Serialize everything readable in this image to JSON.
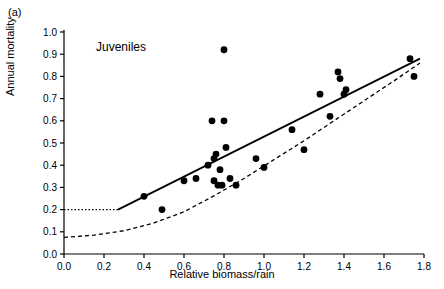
{
  "panel": {
    "label": "(a)"
  },
  "chart_data": {
    "type": "scatter",
    "title": "",
    "series_label": "Juveniles",
    "xlabel": "Relative biomass/rain",
    "ylabel": "Annual mortality",
    "xlim": [
      0.0,
      1.8
    ],
    "ylim": [
      0.0,
      1.0
    ],
    "xticks": [
      0.0,
      0.2,
      0.4,
      0.6,
      0.8,
      1.0,
      1.2,
      1.4,
      1.6,
      1.8
    ],
    "xticklabels": [
      "0.0",
      "0.2",
      "0.4",
      "0.6",
      "0.8",
      "1.0",
      "1.2",
      "1.4",
      "1.6",
      "1.8"
    ],
    "yticks": [
      0.0,
      0.1,
      0.2,
      0.3,
      0.4,
      0.5,
      0.6,
      0.7,
      0.8,
      0.9,
      1.0
    ],
    "yticklabels": [
      "0.0",
      "0.1",
      "0.2",
      "0.3",
      "0.4",
      "0.5",
      "0.6",
      "0.7",
      "0.8",
      "0.9",
      "1.0"
    ],
    "grid": false,
    "legend": "none",
    "points": [
      [
        0.4,
        0.26
      ],
      [
        0.49,
        0.2
      ],
      [
        0.6,
        0.33
      ],
      [
        0.66,
        0.34
      ],
      [
        0.72,
        0.4
      ],
      [
        0.74,
        0.6
      ],
      [
        0.75,
        0.43
      ],
      [
        0.75,
        0.33
      ],
      [
        0.76,
        0.45
      ],
      [
        0.77,
        0.31
      ],
      [
        0.78,
        0.38
      ],
      [
        0.79,
        0.31
      ],
      [
        0.8,
        0.92
      ],
      [
        0.8,
        0.6
      ],
      [
        0.81,
        0.48
      ],
      [
        0.83,
        0.34
      ],
      [
        0.86,
        0.31
      ],
      [
        0.96,
        0.43
      ],
      [
        1.0,
        0.39
      ],
      [
        1.14,
        0.56
      ],
      [
        1.2,
        0.47
      ],
      [
        1.28,
        0.72
      ],
      [
        1.33,
        0.62
      ],
      [
        1.37,
        0.82
      ],
      [
        1.38,
        0.79
      ],
      [
        1.4,
        0.72
      ],
      [
        1.41,
        0.74
      ],
      [
        1.73,
        0.88
      ],
      [
        1.75,
        0.8
      ]
    ],
    "solid_line": {
      "x": [
        0.27,
        1.78
      ],
      "y": [
        0.2,
        0.88
      ]
    },
    "dotted_segment": {
      "x": [
        0.0,
        0.27
      ],
      "y": [
        0.2,
        0.2
      ]
    },
    "dashed_curve": [
      [
        0.0,
        0.075
      ],
      [
        0.15,
        0.085
      ],
      [
        0.3,
        0.105
      ],
      [
        0.45,
        0.14
      ],
      [
        0.6,
        0.19
      ],
      [
        0.75,
        0.262
      ],
      [
        0.9,
        0.34
      ],
      [
        1.05,
        0.425
      ],
      [
        1.2,
        0.51
      ],
      [
        1.35,
        0.6
      ],
      [
        1.5,
        0.69
      ],
      [
        1.65,
        0.78
      ],
      [
        1.78,
        0.86
      ]
    ],
    "colors": {
      "point": "#000000",
      "line": "#000000",
      "axis": "#000000"
    }
  }
}
